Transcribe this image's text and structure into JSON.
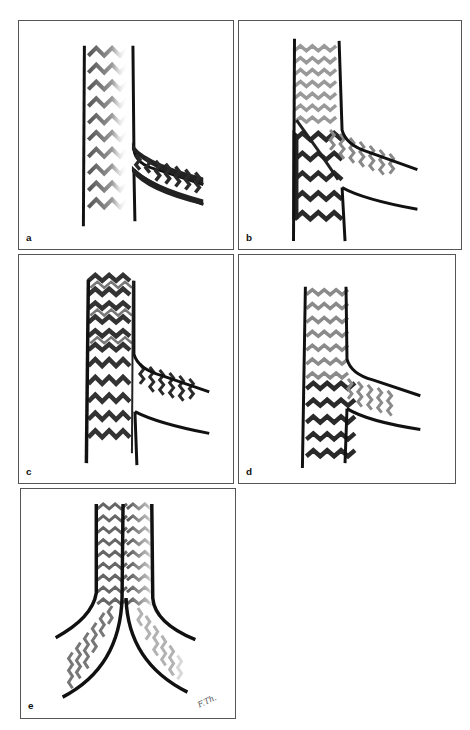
{
  "figure": {
    "panels": [
      {
        "id": "a",
        "label": "a",
        "main_stent": "faded gray (partially deployed)",
        "side_stent": "dark (side branch stent protruding into main vessel)"
      },
      {
        "id": "b",
        "label": "b",
        "main_stent": "gray upper, dark lower (crush / culotte)",
        "side_stent": "gray fading"
      },
      {
        "id": "c",
        "label": "c",
        "main_stent": "dark overlapping",
        "side_stent": "dark"
      },
      {
        "id": "d",
        "label": "d",
        "main_stent": "gray upper, dark lower",
        "side_stent": "gray"
      },
      {
        "id": "e",
        "label": "e",
        "main_stent": "kissing stents (left gray, right fading)",
        "side_stent": "both branches",
        "signature": "F.Th."
      }
    ]
  },
  "colors": {
    "vessel_wall": "#111111",
    "stent_dark": "#2a2a2a",
    "stent_mid": "#6e6e6e",
    "stent_light": "#a8a8a8",
    "panel_border": "#555555"
  }
}
